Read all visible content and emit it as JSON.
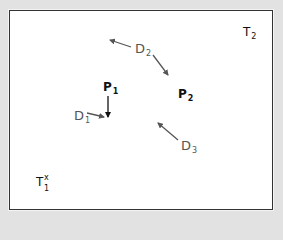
{
  "diagram": {
    "background_color": "#e2e2e2",
    "panel_color": "#ffffff",
    "border_color": "#333333",
    "labels": {
      "p1": {
        "base": "P",
        "sub": "1",
        "color": "#111111"
      },
      "p2": {
        "base": "P",
        "sub": "2",
        "color": "#111111"
      },
      "d1": {
        "base": "D",
        "sub": "1",
        "color": "#555555"
      },
      "d2": {
        "base": "D",
        "sub": "2",
        "color": "#555555"
      },
      "d3": {
        "base": "D",
        "sub": "3",
        "color": "#555555"
      },
      "t1": {
        "base": "T",
        "sub": "1",
        "sup": "x",
        "color": "#111111"
      },
      "t2": {
        "base": "T",
        "sub": "2",
        "color": "#111111"
      }
    },
    "arrows": [
      {
        "from": "D2",
        "direction": "up-left"
      },
      {
        "from": "D2",
        "direction": "down-right toward P2"
      },
      {
        "from": "P1",
        "direction": "down"
      },
      {
        "from": "D1",
        "direction": "right toward P1 arrow tip"
      },
      {
        "from": "D3",
        "direction": "up-left"
      }
    ]
  }
}
